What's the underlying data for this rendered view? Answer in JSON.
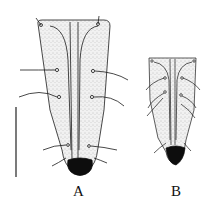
{
  "figure": {
    "panels": [
      {
        "id": "A",
        "label": "A",
        "description": "larger elongated structure with setae and dark tip"
      },
      {
        "id": "B",
        "label": "B",
        "description": "smaller elongated structure with setae and dark tip"
      }
    ],
    "scale_bar": {
      "orientation": "vertical",
      "label": ""
    },
    "colors": {
      "ink": "#1a1a1a",
      "stipple": "#e8e8e8",
      "tip": "#0d0d0d",
      "background": "#ffffff"
    }
  }
}
